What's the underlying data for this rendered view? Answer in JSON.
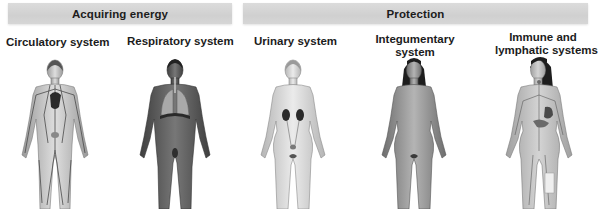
{
  "groups": [
    {
      "id": "energy",
      "label": "Acquiring energy"
    },
    {
      "id": "protection",
      "label": "Protection"
    }
  ],
  "systems": [
    {
      "id": "circulatory",
      "group": "energy",
      "label": "Circulatory system",
      "figure": "male-figure-circulatory"
    },
    {
      "id": "respiratory",
      "group": "energy",
      "label": "Respiratory system",
      "figure": "male-figure-respiratory"
    },
    {
      "id": "urinary",
      "group": "protection",
      "label": "Urinary system",
      "figure": "female-figure-urinary"
    },
    {
      "id": "integumentary",
      "group": "protection",
      "label_line1": "Integumentary",
      "label_line2": "system",
      "figure": "female-figure-integumentary"
    },
    {
      "id": "immune",
      "group": "protection",
      "label_line1": "Immune and",
      "label_line2": "lymphatic systems",
      "figure": "female-figure-immune-lymphatic"
    }
  ],
  "colors": {
    "bar_fill": "#d4d4d4",
    "label_text": "#1c1c1c",
    "skin_light": "#d9d9d9",
    "skin_mid": "#a8a8a8",
    "skin_dark": "#5e5e5e",
    "organ_dark": "#2a2a2a"
  }
}
